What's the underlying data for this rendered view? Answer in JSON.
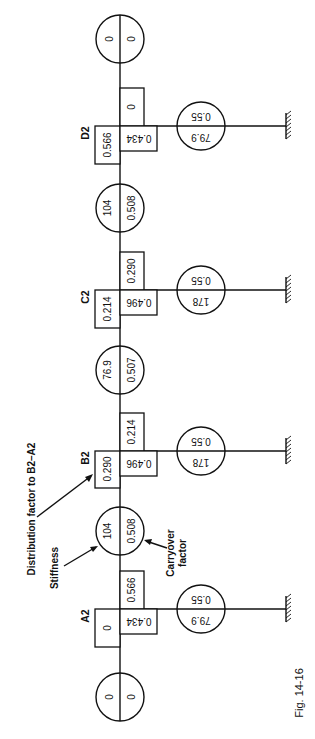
{
  "figure": {
    "caption": "Fig. 14-16",
    "annotations": {
      "distribution_factor": "Distribution factor to B2–A2",
      "stiffness": "Stiffness",
      "carryover_line1": "Carryover",
      "carryover_line2": "factor"
    },
    "end_members": {
      "top": {
        "left": "0",
        "right": "0"
      },
      "bottom": {
        "left": "0",
        "right": "0"
      }
    },
    "beams": [
      {
        "between": "C2-D2",
        "stiffness": "104",
        "carryover": "0.508"
      },
      {
        "between": "B2-C2",
        "stiffness": "76.9",
        "carryover": "0.507"
      },
      {
        "between": "A2-B2",
        "stiffness": "104",
        "carryover": "0.508"
      }
    ],
    "joints": [
      {
        "label": "D2",
        "df_left": "0.566",
        "df_right": "0",
        "df_column": "0.434",
        "column_stiffness": "79.9",
        "column_carryover": "0.55"
      },
      {
        "label": "C2",
        "df_left": "0.214",
        "df_right": "0.290",
        "df_column": "0.496",
        "column_stiffness": "178",
        "column_carryover": "0.55"
      },
      {
        "label": "B2",
        "df_left": "0.290",
        "df_right": "0.214",
        "df_column": "0.496",
        "column_stiffness": "178",
        "column_carryover": "0.55"
      },
      {
        "label": "A2",
        "df_left": "0",
        "df_right": "0.566",
        "df_column": "0.434",
        "column_stiffness": "79.9",
        "column_carryover": "0.55"
      }
    ]
  }
}
